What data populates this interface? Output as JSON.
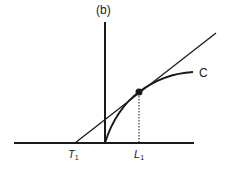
{
  "diagram": {
    "panel_label": "(b)",
    "curve_label": "C",
    "x_labels": [
      {
        "main": "T",
        "sub": "1"
      },
      {
        "main": "L",
        "sub": "1"
      }
    ],
    "colors": {
      "stroke": "#1a1a1a",
      "background": "#ffffff"
    }
  }
}
